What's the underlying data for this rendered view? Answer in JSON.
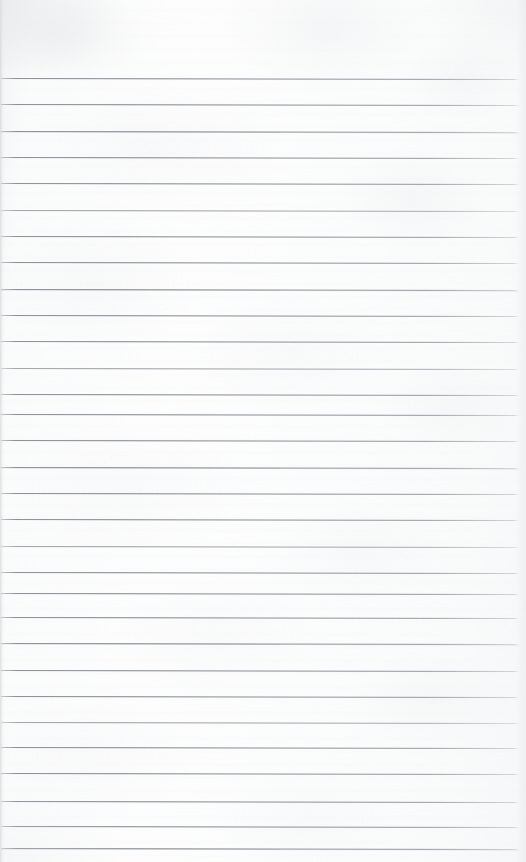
{
  "document": {
    "kind": "lined-paper-scan",
    "title": "Blank ruled notebook page",
    "page_width": 526,
    "page_height": 862,
    "visible_text": "",
    "handwriting": "none",
    "header_text": "",
    "footer_text": "",
    "page_number": ""
  },
  "paper": {
    "background_color": "#fbfbfb",
    "highlight_color": "#fdfdfd",
    "shadow_color": "#f3f4f5",
    "texture": "mottled scan grain",
    "left_edge_color": "#c6c9cc"
  },
  "ruling": {
    "line_color": "#84888d",
    "line_thickness_px": 1,
    "line_count": 30,
    "first_line_y": 78,
    "last_line_y": 848,
    "spacing_px": 26.5,
    "line_left_x": 1,
    "line_right_x": 519,
    "skew_deg": 0.105,
    "top_margin_px": 78,
    "bottom_margin_px": 14,
    "margin_rule": "none",
    "lines": [
      {
        "index": 1,
        "y": 78,
        "weight": "normal"
      },
      {
        "index": 2,
        "y": 104,
        "weight": "normal"
      },
      {
        "index": 3,
        "y": 131,
        "weight": "heavy"
      },
      {
        "index": 4,
        "y": 157,
        "weight": "normal"
      },
      {
        "index": 5,
        "y": 183,
        "weight": "normal"
      },
      {
        "index": 6,
        "y": 210,
        "weight": "light"
      },
      {
        "index": 7,
        "y": 236,
        "weight": "normal"
      },
      {
        "index": 8,
        "y": 262,
        "weight": "normal"
      },
      {
        "index": 9,
        "y": 289,
        "weight": "heavy"
      },
      {
        "index": 10,
        "y": 315,
        "weight": "normal"
      },
      {
        "index": 11,
        "y": 341,
        "weight": "normal"
      },
      {
        "index": 12,
        "y": 368,
        "weight": "light"
      },
      {
        "index": 13,
        "y": 394,
        "weight": "normal"
      },
      {
        "index": 14,
        "y": 414,
        "weight": "normal"
      },
      {
        "index": 15,
        "y": 440,
        "weight": "normal"
      },
      {
        "index": 16,
        "y": 467,
        "weight": "heavy"
      },
      {
        "index": 17,
        "y": 493,
        "weight": "normal"
      },
      {
        "index": 18,
        "y": 519,
        "weight": "normal"
      },
      {
        "index": 19,
        "y": 546,
        "weight": "light"
      },
      {
        "index": 20,
        "y": 572,
        "weight": "normal"
      },
      {
        "index": 21,
        "y": 593,
        "weight": "normal"
      },
      {
        "index": 22,
        "y": 617,
        "weight": "normal"
      },
      {
        "index": 23,
        "y": 643,
        "weight": "heavy"
      },
      {
        "index": 24,
        "y": 670,
        "weight": "normal"
      },
      {
        "index": 25,
        "y": 696,
        "weight": "normal"
      },
      {
        "index": 26,
        "y": 722,
        "weight": "light"
      },
      {
        "index": 27,
        "y": 747,
        "weight": "normal"
      },
      {
        "index": 28,
        "y": 773,
        "weight": "normal"
      },
      {
        "index": 29,
        "y": 801,
        "weight": "normal"
      },
      {
        "index": 30,
        "y": 826,
        "weight": "normal"
      },
      {
        "index": 31,
        "y": 848,
        "weight": "heavy"
      }
    ]
  }
}
